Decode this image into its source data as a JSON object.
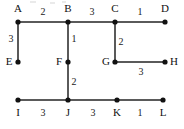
{
  "figure": {
    "kind": "weighted-grid-graph",
    "width": 184,
    "height": 129,
    "background_color": "#ffffff",
    "edge_color": "#5a5a5a",
    "node_color": "#111111",
    "label_color": "#111111"
  },
  "nodes": [
    {
      "id": "A",
      "label": "A",
      "x": 18,
      "y": 22,
      "label_x": 18,
      "label_y": 9,
      "label_anchor": "above"
    },
    {
      "id": "B",
      "label": "B",
      "x": 68,
      "y": 22,
      "label_x": 68,
      "label_y": 9,
      "label_anchor": "above"
    },
    {
      "id": "C",
      "label": "C",
      "x": 115,
      "y": 22,
      "label_x": 115,
      "label_y": 9,
      "label_anchor": "above"
    },
    {
      "id": "D",
      "label": "D",
      "x": 165,
      "y": 22,
      "label_x": 165,
      "label_y": 9,
      "label_anchor": "above"
    },
    {
      "id": "E",
      "label": "E",
      "x": 18,
      "y": 62,
      "label_x": 9,
      "label_y": 62,
      "label_anchor": "left"
    },
    {
      "id": "F",
      "label": "F",
      "x": 68,
      "y": 62,
      "label_x": 59,
      "label_y": 62,
      "label_anchor": "left"
    },
    {
      "id": "G",
      "label": "G",
      "x": 115,
      "y": 62,
      "label_x": 106,
      "label_y": 62,
      "label_anchor": "left"
    },
    {
      "id": "H",
      "label": "H",
      "x": 165,
      "y": 62,
      "label_x": 174,
      "label_y": 62,
      "label_anchor": "right"
    },
    {
      "id": "I",
      "label": "I",
      "x": 18,
      "y": 100,
      "label_x": 18,
      "label_y": 113,
      "label_anchor": "below"
    },
    {
      "id": "J",
      "label": "J",
      "x": 68,
      "y": 100,
      "label_x": 68,
      "label_y": 113,
      "label_anchor": "below"
    },
    {
      "id": "K",
      "label": "K",
      "x": 117,
      "y": 100,
      "label_x": 117,
      "label_y": 113,
      "label_anchor": "below"
    },
    {
      "id": "L",
      "label": "L",
      "x": 163,
      "y": 100,
      "label_x": 163,
      "label_y": 113,
      "label_anchor": "below"
    }
  ],
  "edges": [
    {
      "id": "AB",
      "from": "A",
      "to": "B",
      "weight": "2",
      "orientation": "horizontal",
      "label_x": 43,
      "label_y": 12
    },
    {
      "id": "BC",
      "from": "B",
      "to": "C",
      "weight": "3",
      "orientation": "horizontal",
      "label_x": 92,
      "label_y": 12
    },
    {
      "id": "CD",
      "from": "C",
      "to": "D",
      "weight": "1",
      "orientation": "horizontal",
      "label_x": 140,
      "label_y": 12
    },
    {
      "id": "AE",
      "from": "A",
      "to": "E",
      "weight": "3",
      "orientation": "vertical",
      "label_x": 11,
      "label_y": 39
    },
    {
      "id": "BF",
      "from": "B",
      "to": "F",
      "weight": "1",
      "orientation": "vertical",
      "label_x": 74,
      "label_y": 39
    },
    {
      "id": "CG",
      "from": "C",
      "to": "G",
      "weight": "2",
      "orientation": "vertical",
      "label_x": 121,
      "label_y": 42
    },
    {
      "id": "GH",
      "from": "G",
      "to": "H",
      "weight": "3",
      "orientation": "horizontal",
      "label_x": 141,
      "label_y": 72
    },
    {
      "id": "FJ",
      "from": "F",
      "to": "J",
      "weight": "2",
      "orientation": "vertical",
      "label_x": 74,
      "label_y": 82
    },
    {
      "id": "IJ",
      "from": "I",
      "to": "J",
      "weight": "3",
      "orientation": "horizontal",
      "label_x": 43,
      "label_y": 113
    },
    {
      "id": "JK",
      "from": "J",
      "to": "K",
      "weight": "3",
      "orientation": "horizontal",
      "label_x": 93,
      "label_y": 113
    },
    {
      "id": "KL",
      "from": "K",
      "to": "L",
      "weight": "1",
      "orientation": "horizontal",
      "label_x": 140,
      "label_y": 113
    }
  ]
}
